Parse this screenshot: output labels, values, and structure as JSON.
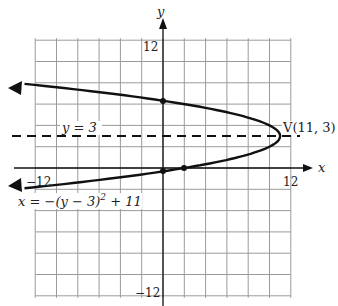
{
  "chart_data": {
    "type": "line",
    "title": "",
    "xlabel": "x",
    "ylabel": "y",
    "xlim": [
      -12,
      12
    ],
    "ylim": [
      -12,
      12
    ],
    "grid": true,
    "grid_step": 2,
    "tick_labels": {
      "x_min": "−12",
      "x_max": "12",
      "y_max": "12",
      "y_min": "−12"
    },
    "series": [
      {
        "name": "x = −(y − 3)² + 11",
        "equation": "x = -(y-3)^2 + 11",
        "kind": "parabola-opening-left",
        "vertex": [
          11,
          3
        ],
        "points": [
          [
            2,
            0
          ],
          [
            0,
            -0.32
          ],
          [
            0,
            6.32
          ],
          [
            -13,
            7.9
          ],
          [
            -13,
            -1.9
          ]
        ]
      },
      {
        "name": "y = 3",
        "kind": "dashed-horizontal-line",
        "y": 3
      }
    ],
    "annotations": [
      {
        "text": "y = 3",
        "at": [
          -6,
          3.6
        ]
      },
      {
        "text": "V(11, 3)",
        "at": [
          11.2,
          3.6
        ]
      },
      {
        "text": "x = −(y − 3)² + 11",
        "at": [
          -14,
          -3
        ]
      }
    ],
    "marked_points": [
      [
        0,
        6.32
      ],
      [
        0,
        -0.32
      ],
      [
        2,
        0
      ]
    ]
  },
  "labels": {
    "axis_x": "x",
    "axis_y": "y",
    "tick_x_min": "−12",
    "tick_x_max": "12",
    "tick_y_max": "12",
    "tick_y_min": "−12",
    "asymptote": "y = 3",
    "vertex": "V(11, 3)",
    "eq_x": "x = −(y − 3)",
    "eq_exp": "2",
    "eq_tail": " + 11"
  }
}
